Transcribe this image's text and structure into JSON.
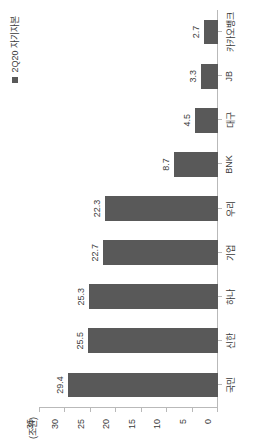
{
  "legend": {
    "marker_name": "legend-square-marker",
    "label": "2Q20 자기자본"
  },
  "axis_title": "(조원)",
  "chart_data": {
    "type": "bar",
    "orientation": "vertical",
    "title": "",
    "subtitle": "",
    "xlabel": "",
    "ylabel": "(조원)",
    "ylim": [
      0,
      35
    ],
    "yticks": [
      0,
      5,
      10,
      15,
      20,
      25,
      30,
      35
    ],
    "ytick_labels": [
      "0",
      "5",
      "10",
      "15",
      "20",
      "25",
      "30",
      "35"
    ],
    "grid": false,
    "legend_position": "top-right",
    "series_color": "#595959",
    "categories": [
      "국민",
      "신한",
      "하나",
      "기업",
      "우리",
      "BNK",
      "대구",
      "JB",
      "카카오뱅크"
    ],
    "series": [
      {
        "name": "2Q20 자기자본",
        "values": [
          29.4,
          25.5,
          25.3,
          22.7,
          22.3,
          8.7,
          4.5,
          3.3,
          2.7
        ],
        "value_labels": [
          "29.4",
          "25.5",
          "25.3",
          "22.7",
          "22.3",
          "8.7",
          "4.5",
          "3.3",
          "2.7"
        ]
      }
    ]
  },
  "colors": {
    "bar": "#595959",
    "axis": "#b9b9b9",
    "text": "#3a3a3a",
    "background": "#ffffff"
  }
}
